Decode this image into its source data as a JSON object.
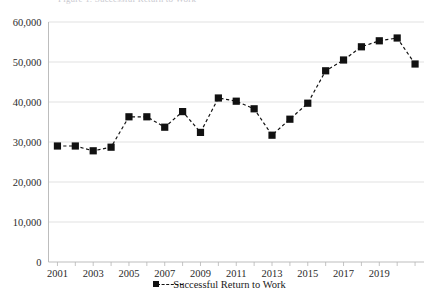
{
  "figure": {
    "cut_off_title": "Figure 1. Successful Return to Work",
    "background_color": "#ffffff",
    "series_color": "#111111",
    "gridline_color": "#d9d9d9",
    "axis_color": "#b5b5b5"
  },
  "legend": {
    "position": "bottom-center",
    "entries": [
      {
        "label": "Successful Return to Work",
        "marker": "square-marker",
        "line_style": "dashed"
      }
    ]
  },
  "chart_data": {
    "type": "line",
    "title": "",
    "xlabel": "",
    "ylabel": "",
    "grid": true,
    "legend_position": "bottom",
    "x": [
      2001,
      2002,
      2003,
      2004,
      2005,
      2006,
      2007,
      2008,
      2009,
      2010,
      2011,
      2012,
      2013,
      2014,
      2015,
      2016,
      2017,
      2018,
      2019,
      2020,
      2021
    ],
    "xlim": [
      2000.5,
      2021.5
    ],
    "ylim": [
      0,
      60000
    ],
    "ytick_labels": [
      "0",
      "10,000",
      "20,000",
      "30,000",
      "40,000",
      "50,000",
      "60,000"
    ],
    "ytick_values": [
      0,
      10000,
      20000,
      30000,
      40000,
      50000,
      60000
    ],
    "xtick_labels": [
      "2001",
      "2003",
      "2005",
      "2007",
      "2009",
      "2011",
      "2013",
      "2015",
      "2017",
      "2019"
    ],
    "xtick_values": [
      2001,
      2003,
      2005,
      2007,
      2009,
      2011,
      2013,
      2015,
      2017,
      2019
    ],
    "series": [
      {
        "name": "Successful Return to Work",
        "marker": "square",
        "line_style": "dashed",
        "color": "#111111",
        "values": [
          29000,
          29000,
          27800,
          28700,
          36300,
          36300,
          33700,
          37600,
          32400,
          41000,
          40200,
          38300,
          31700,
          35700,
          39700,
          47800,
          50500,
          53800,
          55300,
          56000,
          49500
        ]
      }
    ]
  }
}
